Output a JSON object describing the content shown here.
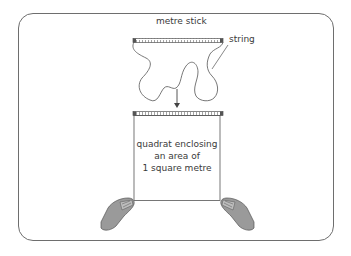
{
  "diagram": {
    "labels": {
      "metre_stick": "metre stick",
      "string": "string"
    },
    "quadrat_caption": {
      "line1": "quadrat enclosing",
      "line2": "an area of",
      "line3": "1 square metre"
    },
    "colors": {
      "line": "#555555",
      "frame": "#6e6e6e",
      "hand_fill": "#9a9a9a",
      "text": "#3a3a3a"
    },
    "icons": [
      "metre-stick",
      "string-loop",
      "down-arrow",
      "left-hand",
      "right-hand"
    ]
  }
}
